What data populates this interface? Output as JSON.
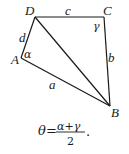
{
  "diagram": {
    "vertices": {
      "A": {
        "label": "A",
        "x": 21,
        "y": 58
      },
      "B": {
        "label": "B",
        "x": 110,
        "y": 106
      },
      "C": {
        "label": "C",
        "x": 104,
        "y": 17
      },
      "D": {
        "label": "D",
        "x": 35,
        "y": 17
      }
    },
    "sides": {
      "a": "a",
      "b": "b",
      "c": "c",
      "d": "d"
    },
    "angles": {
      "alpha": "α",
      "gamma": "γ"
    },
    "formula": {
      "lhs": "θ",
      "equals": "=",
      "numerator": "α+γ",
      "denominator": "2",
      "period": "."
    }
  }
}
